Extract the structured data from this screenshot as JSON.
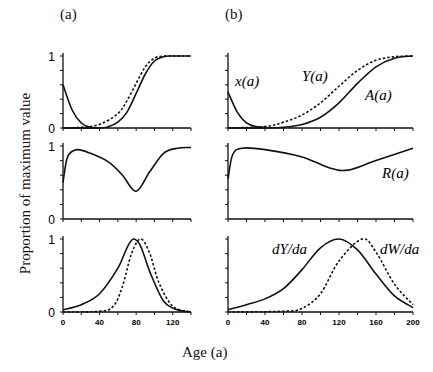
{
  "figure": {
    "panel_a_label": "(a)",
    "panel_b_label": "(b)",
    "ylabel": "Proportion of maximum value",
    "xlabel": "Age (a)"
  },
  "chart_data": [
    {
      "type": "line",
      "panel": "(a) top",
      "xlim": [
        0,
        140
      ],
      "ylim": [
        0,
        1
      ],
      "yticks": [
        "0",
        "1"
      ],
      "series": [
        {
          "name": "x(a)",
          "style": "solid",
          "x": [
            0,
            10,
            20,
            30,
            40
          ],
          "y": [
            0.6,
            0.25,
            0.07,
            0.01,
            0
          ]
        },
        {
          "name": "Y(a)",
          "style": "dashed",
          "x": [
            0,
            20,
            40,
            60,
            70,
            80,
            90,
            100,
            110,
            120,
            140
          ],
          "y": [
            0,
            0.01,
            0.05,
            0.2,
            0.38,
            0.62,
            0.85,
            0.97,
            1,
            1,
            1
          ]
        },
        {
          "name": "A(a)",
          "style": "solid",
          "x": [
            0,
            40,
            50,
            60,
            70,
            80,
            90,
            100,
            110,
            120,
            140
          ],
          "y": [
            0,
            0,
            0.02,
            0.08,
            0.22,
            0.48,
            0.75,
            0.93,
            0.99,
            1,
            1
          ]
        }
      ]
    },
    {
      "type": "line",
      "panel": "(a) middle",
      "xlim": [
        0,
        140
      ],
      "ylim": [
        0,
        1
      ],
      "yticks": [
        "0",
        "1"
      ],
      "series": [
        {
          "name": "R(a)",
          "style": "solid",
          "x": [
            0,
            5,
            15,
            30,
            50,
            65,
            80,
            95,
            110,
            125,
            140
          ],
          "y": [
            0.5,
            0.85,
            0.95,
            0.9,
            0.78,
            0.6,
            0.38,
            0.65,
            0.9,
            0.97,
            0.98
          ]
        }
      ]
    },
    {
      "type": "line",
      "panel": "(a) bottom",
      "xlim": [
        0,
        140
      ],
      "ylim": [
        0,
        1
      ],
      "xticks": [
        "0",
        "40",
        "80",
        "120"
      ],
      "yticks": [
        "0",
        "1"
      ],
      "series": [
        {
          "name": "dY/da",
          "style": "solid",
          "x": [
            0,
            20,
            40,
            60,
            70,
            77,
            85,
            95,
            110,
            125,
            140
          ],
          "y": [
            0.03,
            0.1,
            0.25,
            0.6,
            0.88,
            1,
            0.9,
            0.55,
            0.15,
            0.03,
            0
          ]
        },
        {
          "name": "dW/da",
          "style": "dashed",
          "x": [
            0,
            40,
            55,
            65,
            75,
            85,
            95,
            105,
            120,
            140
          ],
          "y": [
            0,
            0.01,
            0.08,
            0.35,
            0.8,
            1,
            0.8,
            0.4,
            0.08,
            0
          ]
        }
      ]
    },
    {
      "type": "line",
      "panel": "(b) top",
      "xlim": [
        0,
        200
      ],
      "ylim": [
        0,
        1
      ],
      "series": [
        {
          "name": "x(a)",
          "label": "x(a)",
          "style": "solid",
          "x": [
            0,
            10,
            20,
            30,
            40
          ],
          "y": [
            0.5,
            0.22,
            0.07,
            0.02,
            0.01
          ]
        },
        {
          "name": "Y(a)",
          "label": "Y(a)",
          "style": "dashed",
          "x": [
            0,
            40,
            60,
            80,
            100,
            120,
            140,
            160,
            180,
            200
          ],
          "y": [
            0,
            0.02,
            0.08,
            0.18,
            0.35,
            0.58,
            0.8,
            0.94,
            0.99,
            1
          ]
        },
        {
          "name": "A(a)",
          "label": "A(a)",
          "style": "solid",
          "x": [
            0,
            40,
            60,
            80,
            100,
            120,
            140,
            160,
            180,
            200
          ],
          "y": [
            0,
            0,
            0.01,
            0.05,
            0.15,
            0.35,
            0.62,
            0.85,
            0.97,
            1
          ]
        }
      ]
    },
    {
      "type": "line",
      "panel": "(b) middle",
      "xlim": [
        0,
        200
      ],
      "ylim": [
        0,
        1
      ],
      "series": [
        {
          "name": "R(a)",
          "label": "R(a)",
          "style": "solid",
          "x": [
            0,
            5,
            15,
            40,
            80,
            110,
            130,
            160,
            200
          ],
          "y": [
            0.55,
            0.88,
            0.97,
            0.95,
            0.85,
            0.7,
            0.67,
            0.8,
            0.97
          ]
        }
      ]
    },
    {
      "type": "line",
      "panel": "(b) bottom",
      "xlim": [
        0,
        200
      ],
      "ylim": [
        0,
        1
      ],
      "xticks": [
        "0",
        "40",
        "80",
        "120",
        "160",
        "200"
      ],
      "series": [
        {
          "name": "dY/da",
          "label": "dY/da",
          "style": "solid",
          "x": [
            0,
            20,
            40,
            60,
            80,
            100,
            120,
            140,
            160,
            180,
            200
          ],
          "y": [
            0.03,
            0.1,
            0.18,
            0.32,
            0.58,
            0.88,
            1,
            0.85,
            0.52,
            0.22,
            0.06
          ]
        },
        {
          "name": "dW/da",
          "label": "dW/da",
          "style": "dashed",
          "x": [
            0,
            60,
            80,
            100,
            120,
            145,
            160,
            180,
            200
          ],
          "y": [
            0,
            0.01,
            0.05,
            0.25,
            0.7,
            1,
            0.82,
            0.38,
            0.1
          ]
        }
      ]
    }
  ]
}
